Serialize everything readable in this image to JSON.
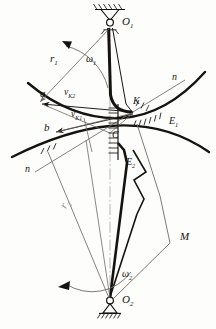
{
  "diagram": {
    "type": "engineering-kinematic-diagram",
    "ink_color": "#15130f",
    "faint_color": "#8d8a84",
    "axis_color": "#9b9892",
    "labels": {
      "pivot_top": "O",
      "pivot_top_sub": "1",
      "pivot_bottom": "O",
      "pivot_bottom_sub": "2",
      "radius_upper": "r",
      "radius_upper_sub": "1",
      "radius_lower": "r",
      "radius_lower_sub": "2",
      "omega_upper": "ω",
      "omega_upper_sub": "1",
      "omega_lower": "ω",
      "omega_lower_sub": "2",
      "vel_k2": "v",
      "vel_k2_sub": "K2",
      "vel_k1": "v",
      "vel_k1_sub": "K1",
      "point_a": "a",
      "point_b": "b",
      "point_c": "C",
      "point_k": "K",
      "point_m": "M",
      "profile_upper": "E",
      "profile_upper_sub": "1",
      "profile_lower": "E",
      "profile_lower_sub": "2",
      "normal_right": "n",
      "normal_left": "n"
    }
  }
}
